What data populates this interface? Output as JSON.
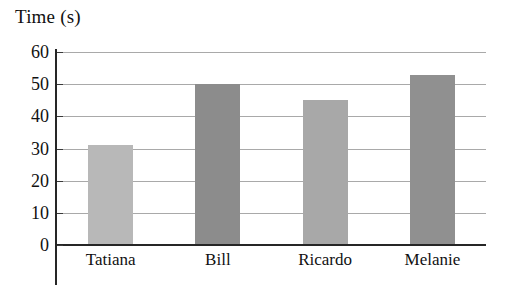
{
  "chart_data": {
    "type": "bar",
    "title": "Time (s)",
    "xlabel": "",
    "ylabel": "Time (s)",
    "categories": [
      "Tatiana",
      "Bill",
      "Ricardo",
      "Melanie"
    ],
    "values": [
      31,
      50,
      45,
      53
    ],
    "series": [
      {
        "name": "Time (s)",
        "values": [
          31,
          50,
          45,
          53
        ]
      }
    ],
    "ylim": [
      0,
      60
    ],
    "y_ticks": [
      "0",
      "10",
      "20",
      "30",
      "40",
      "50",
      "60"
    ],
    "y_tick_values": [
      0,
      10,
      20,
      30,
      40,
      50,
      60
    ],
    "grid": true,
    "grid_axis": "y",
    "legend": false,
    "legend_position": "none",
    "bar_colors": [
      "#b8b8b8",
      "#8c8c8c",
      "#a8a8a8",
      "#909090"
    ],
    "axis_color": "#262626",
    "gridline_color": "#a9a9a9",
    "background_color": "#ffffff"
  }
}
